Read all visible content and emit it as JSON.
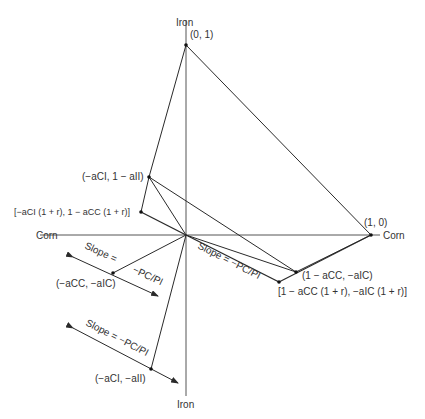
{
  "diagram": {
    "axes": {
      "vertical_label_top": "Iron",
      "vertical_label_bottom": "Iron",
      "horizontal_label_left": "Corn",
      "horizontal_label_right": "Corn"
    },
    "points": {
      "top": "(0, 1)",
      "right": "(1, 0)",
      "upper_left": "(−aCI, 1 − aII)",
      "upper_left_r": "[−aCI (1 + r), 1 − aCC (1 + r)]",
      "lower_right": "(1 − aCC, −aIC)",
      "lower_right_r": "[1 − aCC (1 + r), −aIC (1 + r)]",
      "mid_left": "(−aCC, −aIC)",
      "bottom_left": "(−aCI, −aII)"
    },
    "slope_labels": {
      "right": "Slope = −PC/PI",
      "mid_left_a": "Slope =",
      "mid_left_b": "−PC/PI",
      "bottom": "Slope = −PC/PI"
    },
    "colors": {
      "line": "#2a2a2a",
      "axis": "#555555",
      "text": "#333333"
    }
  }
}
